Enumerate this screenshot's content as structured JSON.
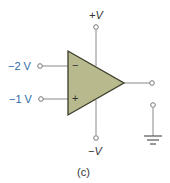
{
  "figure": {
    "caption": "(c)",
    "type": "op-amp comparator circuit"
  },
  "inputs": {
    "inverting": {
      "label": "−2 V",
      "sign": "−"
    },
    "noninverting": {
      "label": "−1 V",
      "sign": "+"
    }
  },
  "supplies": {
    "positive": {
      "label": "+V"
    },
    "negative": {
      "label": "−V"
    }
  },
  "colors": {
    "opamp_fill": "#b8b98c",
    "opamp_stroke": "#3a3a2a",
    "wire": "#8a8a8a",
    "input_label": "#2e6aa8",
    "supply_label": "#333333"
  }
}
